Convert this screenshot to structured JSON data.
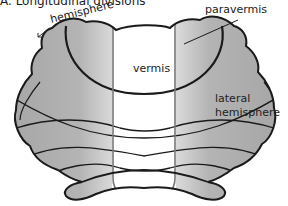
{
  "figure": {
    "title": "A. Longitudinal divisions",
    "labels": {
      "hemisphere": "hemisphere",
      "paravermis": "paravermis",
      "vermis": "vermis",
      "lateral_hemisphere_line1": "lateral",
      "lateral_hemisphere_line2": "hemisphere"
    },
    "colors": {
      "outline": "#1a1a1a",
      "fill_gray": "#a8a8a8",
      "fill_light": "#ffffff",
      "vermis_border": "#777777"
    }
  }
}
